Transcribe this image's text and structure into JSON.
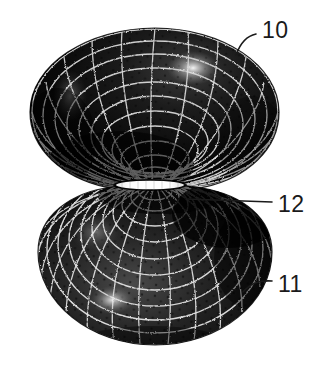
{
  "figure": {
    "kind": "patent-line-drawing",
    "background_color": "#ffffff",
    "ink_color": "#1a1a1a",
    "mesh_color": "#d9d9d9",
    "body_color": "#0b0b0b",
    "highlight_color": "#ffffff",
    "reference_numerals": [
      {
        "id": "10",
        "label": "10",
        "target": "upper-mesh-bowl",
        "text_x": 262,
        "text_y": 38,
        "leader": "M256,34 C246,36 240,44 236,55"
      },
      {
        "id": "12",
        "label": "12",
        "target": "waist-slit-opening",
        "text_x": 278,
        "text_y": 212,
        "leader": "M272,202 L186,199"
      },
      {
        "id": "11",
        "label": "11",
        "target": "lower-mesh-bowl",
        "text_x": 278,
        "text_y": 292,
        "leader": "M272,281 C258,280 250,284 243,292"
      }
    ],
    "parts": [
      {
        "name": "upper-mesh-bowl",
        "numeral": "10"
      },
      {
        "name": "lower-mesh-bowl",
        "numeral": "11"
      },
      {
        "name": "waist-slit-opening",
        "numeral": "12"
      }
    ]
  }
}
